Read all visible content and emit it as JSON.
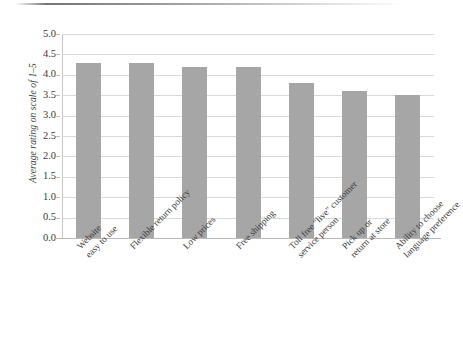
{
  "chart_data": {
    "type": "bar",
    "title": "",
    "xlabel": "",
    "ylabel": "Average rating on scale of 1–5",
    "ylim": [
      0.0,
      5.0
    ],
    "ytick_step": 0.5,
    "grid": true,
    "legend": false,
    "bar_color": "#a6a6a6",
    "categories": [
      "Website easy to use",
      "Flexible return policy",
      "Low prices",
      "Free shipping",
      "Toll free \"live\" customer service person",
      "Pick up or return at store",
      "Ability to choose language preference"
    ],
    "category_lines": [
      [
        "Website",
        "easy to use"
      ],
      [
        "Flexible return policy"
      ],
      [
        "Low prices"
      ],
      [
        "Free shipping"
      ],
      [
        "Toll free \"live\" customer",
        "service person"
      ],
      [
        "Pick up or",
        "return at store"
      ],
      [
        "Ability to choose",
        "language preference"
      ]
    ],
    "values": [
      4.3,
      4.3,
      4.2,
      4.2,
      3.8,
      3.6,
      3.5
    ],
    "ytick_labels": [
      "5.0",
      "4.5",
      "4.0",
      "3.5",
      "3.0",
      "2.5",
      "2.0",
      "1.5",
      "1.0",
      "0.5",
      "0.0"
    ],
    "ytick_values": [
      5.0,
      4.5,
      4.0,
      3.5,
      3.0,
      2.5,
      2.0,
      1.5,
      1.0,
      0.5,
      0.0
    ]
  }
}
